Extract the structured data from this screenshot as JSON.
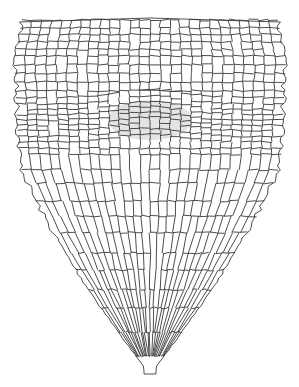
{
  "diagram": {
    "regions": [
      {
        "name": "root-body",
        "description": "elongated cell files converging toward meristem"
      },
      {
        "name": "quiescent-center",
        "description": "stippled small-cell region at apex of root body"
      },
      {
        "name": "root-cap",
        "description": "large cells tapering to a point below the meristem"
      }
    ],
    "colors": {
      "background": "#ffffff",
      "cell_wall": "#3a3a3a",
      "stipple": "#d9d9d9"
    }
  }
}
